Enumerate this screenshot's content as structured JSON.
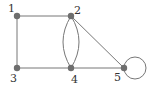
{
  "diagram": {
    "type": "graph",
    "colors": {
      "edge": "#777777",
      "node": "#6e6e6e",
      "label": "#333333"
    },
    "nodes": [
      {
        "id": "1",
        "label": "1",
        "x": 17,
        "y": 16,
        "lx": 8,
        "ly": 12
      },
      {
        "id": "2",
        "label": "2",
        "x": 71,
        "y": 16,
        "lx": 74,
        "ly": 14
      },
      {
        "id": "3",
        "label": "3",
        "x": 17,
        "y": 68,
        "lx": 10,
        "ly": 82
      },
      {
        "id": "4",
        "label": "4",
        "x": 71,
        "y": 68,
        "lx": 71,
        "ly": 83
      },
      {
        "id": "5",
        "label": "5",
        "x": 124,
        "y": 68,
        "lx": 114,
        "ly": 81
      }
    ],
    "edges": [
      {
        "from": "1",
        "to": "2",
        "kind": "straight"
      },
      {
        "from": "1",
        "to": "3",
        "kind": "straight"
      },
      {
        "from": "3",
        "to": "4",
        "kind": "straight"
      },
      {
        "from": "4",
        "to": "5",
        "kind": "straight"
      },
      {
        "from": "2",
        "to": "5",
        "kind": "straight"
      },
      {
        "from": "2",
        "to": "4",
        "kind": "curve",
        "bulge": -8
      },
      {
        "from": "2",
        "to": "4",
        "kind": "curve",
        "bulge": 8
      },
      {
        "from": "5",
        "to": "5",
        "kind": "loop",
        "cx": 135,
        "cy": 68,
        "r": 11
      }
    ]
  }
}
